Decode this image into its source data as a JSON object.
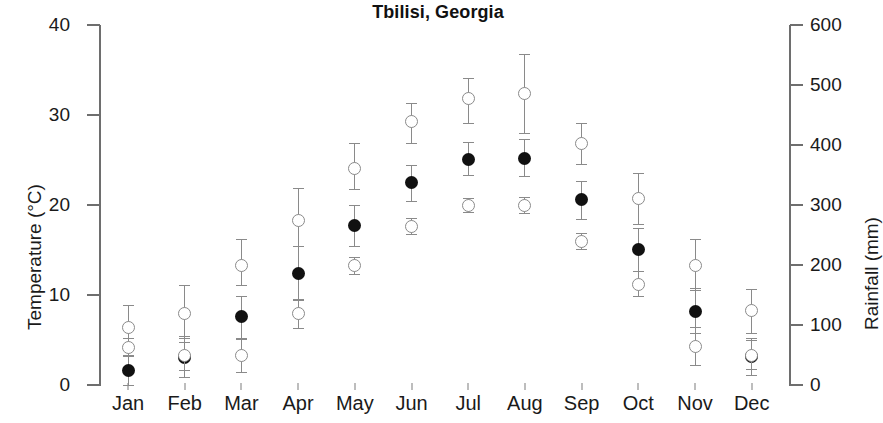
{
  "chart_data": {
    "type": "scatter",
    "title": "Tbilisi, Georgia",
    "xlabel": "",
    "ylabel": "Temperature (°C)",
    "y2label": "Rainfall (mm)",
    "categories": [
      "Jan",
      "Feb",
      "Mar",
      "Apr",
      "May",
      "Jun",
      "Jul",
      "Aug",
      "Sep",
      "Oct",
      "Nov",
      "Dec"
    ],
    "ylim": [
      0,
      40
    ],
    "y2lim": [
      0,
      600
    ],
    "yticks": [
      0,
      10,
      20,
      30,
      40
    ],
    "y2ticks": [
      0,
      100,
      200,
      300,
      400,
      500,
      600
    ],
    "grid": false,
    "legend": "none",
    "series": [
      {
        "name": "Temperature",
        "axis": "left",
        "marker": "filled-circle",
        "units": "°C",
        "values": [
          1.6,
          3.1,
          7.6,
          12.4,
          17.7,
          22.5,
          25.1,
          25.2,
          20.6,
          15.1,
          8.2,
          3.2
        ],
        "err_low": [
          0.0,
          0.9,
          5.1,
          9.4,
          15.4,
          20.4,
          23.3,
          23.2,
          18.4,
          12.7,
          5.8,
          1.1
        ],
        "err_high": [
          3.3,
          5.4,
          9.9,
          15.4,
          20.0,
          24.4,
          27.0,
          27.3,
          22.7,
          17.4,
          10.8,
          5.2
        ]
      },
      {
        "name": "Rainfall upper",
        "axis": "right",
        "marker": "open-circle",
        "units": "mm",
        "values": [
          96,
          119,
          200,
          274,
          361,
          440,
          477,
          486,
          403,
          311,
          200,
          124
        ],
        "err_low": [
          63,
          79,
          166,
          232,
          327,
          403,
          437,
          420,
          369,
          269,
          159,
          87
        ],
        "err_high": [
          133,
          166,
          243,
          328,
          403,
          470,
          512,
          552,
          437,
          353,
          244,
          160
        ]
      },
      {
        "name": "Rainfall lower",
        "axis": "right",
        "marker": "open-circle",
        "units": "mm",
        "values": [
          63,
          49,
          50,
          119,
          199,
          265,
          299,
          299,
          240,
          168,
          65,
          50
        ],
        "err_low": [
          48,
          25,
          22,
          95,
          185,
          252,
          289,
          286,
          227,
          148,
          34,
          26
        ],
        "err_high": [
          78,
          72,
          79,
          143,
          213,
          279,
          311,
          313,
          254,
          190,
          97,
          75
        ]
      }
    ]
  },
  "axes": {
    "left_title": "Temperature (°C)",
    "right_title": "Rainfall (mm)",
    "left_ticks": [
      "40",
      "30",
      "20",
      "10",
      "0"
    ],
    "right_ticks": [
      "600",
      "500",
      "400",
      "300",
      "200",
      "100",
      "0"
    ]
  },
  "header": {
    "title": "Tbilisi, Georgia"
  }
}
